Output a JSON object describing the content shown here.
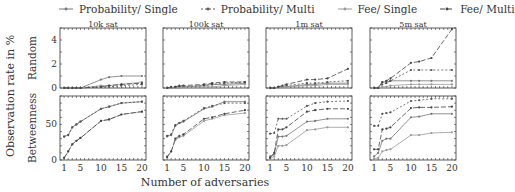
{
  "legend": [
    {
      "label": "Probability/ Single",
      "key": "prob_single",
      "dash": "none",
      "color": "#777777",
      "marker": "dot"
    },
    {
      "label": "Probability/ Multi",
      "key": "prob_multi",
      "dash": "2,2",
      "color": "#555555",
      "marker": "dot"
    },
    {
      "label": "Fee/ Single",
      "key": "fee_single",
      "dash": "none",
      "color": "#999999",
      "marker": "dot"
    },
    {
      "label": "Fee/ Multi",
      "key": "fee_multi",
      "dash": "5,2",
      "color": "#444444",
      "marker": "dot"
    }
  ],
  "ylabel_outer": "Observation rate in %",
  "xlabel": "Number of adversaries",
  "chart_data": [
    {
      "type": "line",
      "title": "10k sat",
      "row": "Random",
      "ylim": [
        0,
        5
      ],
      "yticks": [
        0,
        2,
        4
      ],
      "x": [
        1,
        2,
        3,
        4,
        5,
        10,
        12,
        15,
        20
      ],
      "xticks": [
        1,
        5,
        10,
        15,
        20
      ],
      "series": [
        {
          "name": "Probability/ Single",
          "values": [
            0,
            0,
            0,
            0,
            0,
            0.7,
            0.9,
            1.0,
            1.0
          ]
        },
        {
          "name": "Probability/ Multi",
          "values": [
            0,
            0,
            0,
            0,
            0,
            0.1,
            0.1,
            0.2,
            0.3
          ]
        },
        {
          "name": "Fee/ Single",
          "values": [
            0,
            0,
            0,
            0,
            0,
            0.2,
            0.2,
            0.3,
            0.5
          ]
        },
        {
          "name": "Fee/ Multi",
          "values": [
            0,
            0,
            0,
            0,
            0,
            0.1,
            0.2,
            0.3,
            0.4
          ]
        }
      ]
    },
    {
      "type": "line",
      "title": "100k sat",
      "row": "Random",
      "ylim": [
        0,
        5
      ],
      "yticks": [
        0,
        2,
        4
      ],
      "x": [
        1,
        2,
        3,
        4,
        5,
        10,
        12,
        15,
        20
      ],
      "xticks": [
        1,
        5,
        10,
        15,
        20
      ],
      "series": [
        {
          "name": "Probability/ Single",
          "values": [
            0,
            0,
            0.1,
            0.1,
            0.1,
            0.2,
            0.3,
            0.3,
            0.4
          ]
        },
        {
          "name": "Probability/ Multi",
          "values": [
            0,
            0,
            0.05,
            0.1,
            0.1,
            0.2,
            0.3,
            0.4,
            0.5
          ]
        },
        {
          "name": "Fee/ Single",
          "values": [
            0,
            0,
            0,
            0,
            0.1,
            0.1,
            0.1,
            0.2,
            0.3
          ]
        },
        {
          "name": "Fee/ Multi",
          "values": [
            0,
            0.1,
            0.1,
            0.2,
            0.2,
            0.3,
            0.4,
            0.5,
            0.5
          ]
        }
      ]
    },
    {
      "type": "line",
      "title": "1m sat",
      "row": "Random",
      "ylim": [
        0,
        5
      ],
      "yticks": [
        0,
        2,
        4
      ],
      "x": [
        1,
        2,
        3,
        4,
        5,
        10,
        12,
        15,
        20
      ],
      "xticks": [
        1,
        5,
        10,
        15,
        20
      ],
      "series": [
        {
          "name": "Probability/ Single",
          "values": [
            0,
            0,
            0.1,
            0.1,
            0.1,
            0.3,
            0.3,
            0.4,
            0.4
          ]
        },
        {
          "name": "Probability/ Multi",
          "values": [
            0,
            0,
            0.1,
            0.1,
            0.2,
            0.4,
            0.4,
            0.5,
            0.6
          ]
        },
        {
          "name": "Fee/ Single",
          "values": [
            0,
            0,
            0,
            0.1,
            0.1,
            0.2,
            0.2,
            0.3,
            0.3
          ]
        },
        {
          "name": "Fee/ Multi",
          "values": [
            0,
            0,
            0.1,
            0.2,
            0.3,
            0.7,
            0.7,
            0.8,
            1.6
          ]
        }
      ]
    },
    {
      "type": "line",
      "title": "5m sat",
      "row": "Random",
      "ylim": [
        0,
        5
      ],
      "yticks": [
        0,
        2,
        4
      ],
      "x": [
        1,
        2,
        3,
        4,
        5,
        10,
        12,
        15,
        20
      ],
      "xticks": [
        1,
        5,
        10,
        15,
        20
      ],
      "series": [
        {
          "name": "Probability/ Single",
          "values": [
            0,
            0,
            0.5,
            0.5,
            0.6,
            0.6,
            0.6,
            0.6,
            0.6
          ]
        },
        {
          "name": "Probability/ Multi",
          "values": [
            0,
            0,
            0.3,
            0.4,
            0.6,
            1.5,
            1.5,
            1.5,
            1.5
          ]
        },
        {
          "name": "Fee/ Single",
          "values": [
            0,
            0,
            0.1,
            0.1,
            0.2,
            0.3,
            0.3,
            0.3,
            0.3
          ]
        },
        {
          "name": "Fee/ Multi",
          "values": [
            0,
            0,
            0.5,
            0.6,
            0.8,
            2.1,
            2.2,
            2.5,
            4.9
          ]
        }
      ]
    },
    {
      "type": "line",
      "title": "",
      "row": "Betweenness",
      "ylim": [
        0,
        90
      ],
      "yticks": [
        0,
        50
      ],
      "x": [
        1,
        2,
        3,
        4,
        5,
        10,
        12,
        15,
        20
      ],
      "xticks": [
        1,
        5,
        10,
        15,
        20
      ],
      "series": [
        {
          "name": "Probability/ Single",
          "values": [
            33,
            35,
            46,
            50,
            54,
            72,
            75,
            80,
            82
          ]
        },
        {
          "name": "Probability/ Multi",
          "values": [
            33,
            35,
            46,
            50,
            54,
            72,
            75,
            80,
            82
          ]
        },
        {
          "name": "Fee/ Single",
          "values": [
            3,
            12,
            22,
            27,
            31,
            55,
            57,
            64,
            68
          ]
        },
        {
          "name": "Fee/ Multi",
          "values": [
            3,
            12,
            22,
            27,
            31,
            55,
            57,
            64,
            68
          ]
        }
      ]
    },
    {
      "type": "line",
      "title": "",
      "row": "Betweenness",
      "ylim": [
        0,
        90
      ],
      "yticks": [
        0,
        50
      ],
      "x": [
        1,
        2,
        3,
        4,
        5,
        10,
        12,
        15,
        20
      ],
      "xticks": [
        1,
        5,
        10,
        15,
        20
      ],
      "series": [
        {
          "name": "Probability/ Single",
          "values": [
            33,
            35,
            48,
            52,
            54,
            72,
            75,
            82,
            82
          ]
        },
        {
          "name": "Probability/ Multi",
          "values": [
            34,
            36,
            49,
            52,
            55,
            73,
            76,
            80,
            80
          ]
        },
        {
          "name": "Fee/ Single",
          "values": [
            5,
            12,
            28,
            32,
            34,
            55,
            58,
            63,
            66
          ]
        },
        {
          "name": "Fee/ Multi",
          "values": [
            4,
            12,
            30,
            34,
            36,
            58,
            60,
            65,
            70
          ]
        }
      ]
    },
    {
      "type": "line",
      "title": "",
      "row": "Betweenness",
      "ylim": [
        0,
        90
      ],
      "yticks": [
        0,
        50
      ],
      "x": [
        1,
        2,
        3,
        4,
        5,
        10,
        12,
        15,
        20
      ],
      "xticks": [
        1,
        5,
        10,
        15,
        20
      ],
      "series": [
        {
          "name": "Probability/ Single",
          "values": [
            5,
            8,
            33,
            33,
            34,
            54,
            55,
            58,
            58
          ]
        },
        {
          "name": "Probability/ Multi",
          "values": [
            37,
            38,
            58,
            58,
            58,
            76,
            80,
            82,
            83
          ]
        },
        {
          "name": "Fee/ Single",
          "values": [
            2,
            5,
            20,
            20,
            21,
            42,
            43,
            46,
            46
          ]
        },
        {
          "name": "Fee/ Multi",
          "values": [
            3,
            10,
            43,
            43,
            46,
            68,
            70,
            72,
            72
          ]
        }
      ]
    },
    {
      "type": "line",
      "title": "",
      "row": "Betweenness",
      "ylim": [
        0,
        90
      ],
      "yticks": [
        0,
        50
      ],
      "x": [
        1,
        2,
        3,
        4,
        5,
        10,
        12,
        15,
        20
      ],
      "xticks": [
        1,
        5,
        10,
        15,
        20
      ],
      "series": [
        {
          "name": "Probability/ Single",
          "values": [
            5,
            10,
            27,
            30,
            30,
            60,
            61,
            65,
            65
          ]
        },
        {
          "name": "Probability/ Multi",
          "values": [
            48,
            48,
            65,
            66,
            67,
            83,
            84,
            86,
            86
          ]
        },
        {
          "name": "Fee/ Single",
          "values": [
            2,
            3,
            12,
            14,
            15,
            35,
            35,
            38,
            39
          ]
        },
        {
          "name": "Fee/ Multi",
          "values": [
            15,
            15,
            43,
            44,
            46,
            73,
            74,
            74,
            75
          ]
        }
      ]
    }
  ]
}
